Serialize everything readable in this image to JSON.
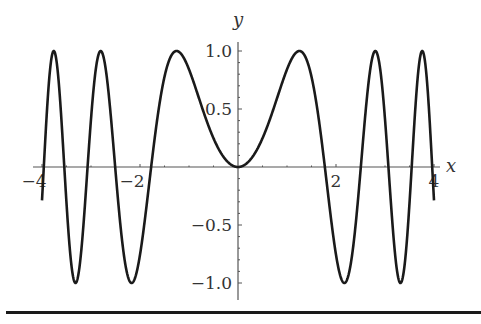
{
  "chart_data": {
    "type": "line",
    "title": "",
    "function": "y = sin(x^2)",
    "xlabel": "x",
    "ylabel": "y",
    "xlim": [
      -4.1,
      4.1
    ],
    "ylim": [
      -1.05,
      1.05
    ],
    "x_ticks": [
      -4,
      -2,
      2,
      4
    ],
    "x_tick_labels": [
      "−4",
      "−2",
      "2",
      "4"
    ],
    "y_ticks": [
      1.0,
      0.5,
      -0.5,
      -1.0
    ],
    "y_tick_labels": [
      "1.0",
      "0.5",
      "−0.5",
      "−1.0"
    ],
    "grid": false,
    "legend": null,
    "series": [
      {
        "name": "sin(x^2)",
        "color": "#1a1a1a",
        "x_range": [
          -4,
          4
        ],
        "sample_points": [
          {
            "x": -4.0,
            "y": -0.288
          },
          {
            "x": -3.545,
            "y": 1.0
          },
          {
            "x": -3.07,
            "y": -1.0
          },
          {
            "x": -2.507,
            "y": 1.0
          },
          {
            "x": -2.171,
            "y": -1.0
          },
          {
            "x": -1.253,
            "y": 1.0
          },
          {
            "x": 0.0,
            "y": 0.0
          },
          {
            "x": 1.253,
            "y": 1.0
          },
          {
            "x": 2.171,
            "y": -1.0
          },
          {
            "x": 2.507,
            "y": 1.0
          },
          {
            "x": 3.07,
            "y": -1.0
          },
          {
            "x": 3.545,
            "y": 1.0
          },
          {
            "x": 4.0,
            "y": -0.288
          }
        ]
      }
    ]
  },
  "layout": {
    "origin_px": [
      238,
      167
    ],
    "px_per_x_unit": 49,
    "px_per_y_unit": 116,
    "axis_color": "#555555",
    "curve_color": "#1a1a1a"
  }
}
